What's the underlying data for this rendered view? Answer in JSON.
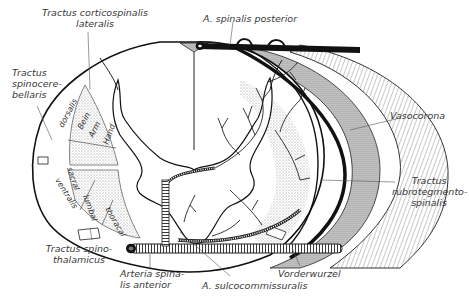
{
  "figure": {
    "labels": {
      "tractus_corticospinalis": [
        "Tractus corticospinalis",
        "lateralis"
      ],
      "a_spinalis_posterior": "A. spinalis posterior",
      "tractus_spinocerebellaris": [
        "Tractus",
        "spinocere-",
        "bellaris"
      ],
      "vasocorona": "Vasocorona",
      "tractus_rubrotegmentospinalis": [
        "Tractus",
        "rubrotegmento-",
        "spinalis"
      ],
      "tractus_spinothalamicus": [
        "Tractus spino-",
        "thalamicus"
      ],
      "arteria_spinalis_anterior": [
        "Arteria spina-",
        "lis anterior"
      ],
      "a_sulcocommissuralis": "A. sulcocommissuralis",
      "vorderwurzel": "Vorderwurzel"
    },
    "inner_labels": {
      "dorsalis": "dorsalis",
      "ventralis": "ventralis",
      "bein": "Bein",
      "arm": "Arm",
      "hand": "Hand",
      "sacral": "sacral",
      "lumbal": "lumbal",
      "thoracal": "thoracal"
    },
    "colors": {
      "ink": "#1a1a1a",
      "stipple": "#c8c8c8",
      "hatch": "#9a9a9a",
      "paper": "#ffffff"
    }
  }
}
